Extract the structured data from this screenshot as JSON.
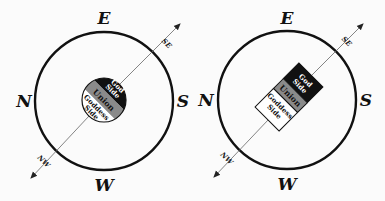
{
  "diagrams": [
    {
      "id": "left",
      "shape": "circle",
      "directions": {
        "east": "E",
        "west": "W",
        "north": "N",
        "south": "S",
        "southeast": "SE",
        "northwest": "NW"
      },
      "bands": {
        "top": "God Side",
        "top_line1": "God",
        "top_line2": "Side",
        "middle": "Union",
        "bottom_line1": "Goddess",
        "bottom_line2": "Side"
      }
    },
    {
      "id": "right",
      "shape": "rectangle",
      "directions": {
        "east": "E",
        "west": "W",
        "north": "N",
        "south": "S",
        "southeast": "SE",
        "northwest": "NW"
      },
      "bands": {
        "top": "God Side",
        "top_line1": "God",
        "top_line2": "Side",
        "middle": "Union",
        "bottom_line1": "Goddess",
        "bottom_line2": "Side"
      }
    }
  ],
  "colors": {
    "god": "#111111",
    "union": "#8a8a8a",
    "goddess": "#ffffff",
    "ring": "#111111",
    "axis": "#555555"
  }
}
